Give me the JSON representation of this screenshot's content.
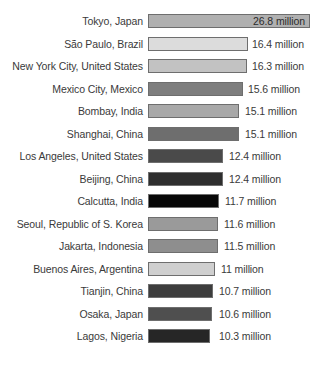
{
  "chart_data": {
    "type": "bar",
    "orientation": "horizontal",
    "title": "",
    "subtitle": "",
    "xlabel": "",
    "ylabel": "",
    "grid": false,
    "legend": null,
    "axis_visible": false,
    "value_suffix": "million",
    "xlim": [
      0,
      26.8
    ],
    "categories": [
      "Tokyo, Japan",
      "São Paulo, Brazil",
      "New York City, United States",
      "Mexico City, Mexico",
      "Bombay, India",
      "Shanghai, China",
      "Los Angeles, United States",
      "Beijing, China",
      "Calcutta, India",
      "Seoul, Republic of S. Korea",
      "Jakarta, Indonesia",
      "Buenos Aires, Argentina",
      "Tianjin, China",
      "Osaka, Japan",
      "Lagos, Nigeria"
    ],
    "values": [
      26.8,
      16.4,
      16.3,
      15.6,
      15.1,
      15.1,
      12.4,
      12.4,
      11.7,
      11.6,
      11.5,
      11,
      10.7,
      10.6,
      10.3
    ],
    "value_labels": [
      "26.8 million",
      "16.4 million",
      "16.3 million",
      "15.6 million",
      "15.1 million",
      "15.1 million",
      "12.4 million",
      "12.4 million",
      "11.7 million",
      "11.6 million",
      "11.5 million",
      "11 million",
      "10.7 million",
      "10.6 million",
      "10.3 million"
    ],
    "bar_colors": [
      "#b0b0b0",
      "#dcdcdc",
      "#c2c2c2",
      "#7e7e7e",
      "#a8a8a8",
      "#6e6e6e",
      "#4a4a4a",
      "#2e2e2e",
      "#070707",
      "#9a9a9a",
      "#8e8e8e",
      "#cfcfcf",
      "#3d3d3d",
      "#4f4f4f",
      "#262626"
    ],
    "bar_border_color": "#6e6e6e"
  },
  "layout": {
    "rows": [
      {
        "top": 13,
        "bar_width": 162,
        "value_x": 246,
        "value_inside": true
      },
      {
        "top": 36,
        "bar_width": 100,
        "value_x": 252,
        "value_inside": false
      },
      {
        "top": 58,
        "bar_width": 99,
        "value_x": 252,
        "value_inside": false
      },
      {
        "top": 81,
        "bar_width": 95,
        "value_x": 248,
        "value_inside": false
      },
      {
        "top": 103,
        "bar_width": 91,
        "value_x": 245,
        "value_inside": false
      },
      {
        "top": 126,
        "bar_width": 91,
        "value_x": 245,
        "value_inside": false
      },
      {
        "top": 148,
        "bar_width": 75,
        "value_x": 229,
        "value_inside": false
      },
      {
        "top": 171,
        "bar_width": 75,
        "value_x": 229,
        "value_inside": false
      },
      {
        "top": 193,
        "bar_width": 71,
        "value_x": 225,
        "value_inside": false
      },
      {
        "top": 216,
        "bar_width": 70,
        "value_x": 224,
        "value_inside": false
      },
      {
        "top": 238,
        "bar_width": 70,
        "value_x": 224,
        "value_inside": false
      },
      {
        "top": 261,
        "bar_width": 67,
        "value_x": 221,
        "value_inside": false
      },
      {
        "top": 283,
        "bar_width": 65,
        "value_x": 219,
        "value_inside": false
      },
      {
        "top": 306,
        "bar_width": 64,
        "value_x": 219,
        "value_inside": false
      },
      {
        "top": 328,
        "bar_width": 62,
        "value_x": 219,
        "value_inside": false
      }
    ]
  }
}
